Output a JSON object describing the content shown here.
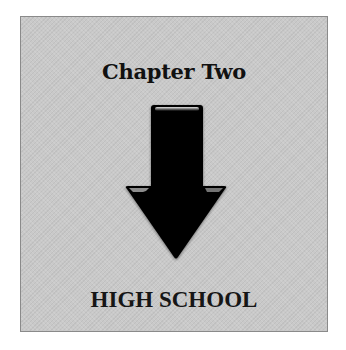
{
  "header": {
    "chapter_label": "Chapter Two"
  },
  "graphic": {
    "icon": "down-arrow-icon",
    "color": "#000000",
    "background": "#c9c9c9"
  },
  "footer": {
    "section_title": "HIGH SCHOOL"
  }
}
